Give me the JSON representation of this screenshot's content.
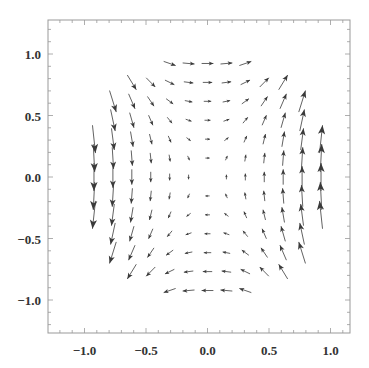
{
  "chart_data": {
    "type": "vector_field",
    "title": "",
    "xlabel": "",
    "ylabel": "",
    "xlim": [
      -1.25,
      1.25
    ],
    "ylim": [
      -1.25,
      1.25
    ],
    "grid": false,
    "legend": null,
    "x_ticks": [
      -1.0,
      -0.5,
      0.0,
      0.5,
      1.0
    ],
    "y_ticks": [
      -1.0,
      -0.5,
      0.0,
      0.5,
      1.0
    ],
    "x_tick_labels": [
      "−1.0",
      "−0.5",
      "0.0",
      "0.5",
      "1.0"
    ],
    "y_tick_labels": [
      "−1.0",
      "−0.5",
      "0.0",
      "0.5",
      "1.0"
    ],
    "sample_grid": {
      "n": 13,
      "min": -0.923,
      "max": 0.923,
      "region": "disk radius 1.0"
    },
    "field_description": "Arrows point down for x<0 and up for x>0, rightward along top (y>0) and leftward along bottom (y<0); magnitude grows strongly with |x| (largest at left/right edges), tiny near center.",
    "field_model": {
      "vx": "0.35*y*r",
      "vy": "1.15*x*|x|"
    },
    "arrow_color": "#3a3a3a",
    "frame_color": "#999999"
  }
}
